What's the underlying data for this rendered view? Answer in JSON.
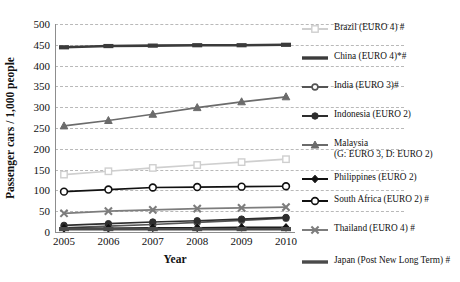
{
  "chart_data": {
    "type": "line",
    "title": "",
    "xlabel": "Year",
    "ylabel": "Passenger cars / 1,000 people",
    "x": [
      2005,
      2006,
      2007,
      2008,
      2009,
      2010
    ],
    "xticklabels": [
      "2005",
      "2006",
      "2007",
      "2008",
      "2009",
      "2010"
    ],
    "yticklabels": [
      "0",
      "50",
      "100",
      "150",
      "200",
      "250",
      "300",
      "350",
      "400",
      "450",
      "500"
    ],
    "ylim": [
      0,
      500
    ],
    "ytick_step": 50,
    "grid": "horizontal-dashed",
    "legend_position": "right-outside",
    "series": [
      {
        "name": "Brazil (EURO 4) #",
        "legend_label": "Brazil (EURO 4) #",
        "color": "#cfcfcf",
        "marker": "square-open",
        "values": [
          138,
          146,
          154,
          161,
          168,
          175
        ]
      },
      {
        "name": "China  (EURO 4)*#",
        "legend_label": "China  (EURO 4)*#",
        "color": "#3b3b3b",
        "marker": "rect-thick",
        "values": [
          444,
          447,
          448,
          449,
          449,
          450
        ]
      },
      {
        "name": "India (EURO 3)#",
        "legend_label": "India (EURO 3)#",
        "color": "#555555",
        "marker": "circle-small",
        "values": [
          10,
          14,
          18,
          23,
          28,
          33
        ]
      },
      {
        "name": "Indonesia (EURO 2)",
        "legend_label": "Indonesia (EURO 2)",
        "color": "#2e2e2e",
        "marker": "circle-filled",
        "values": [
          16,
          20,
          24,
          27,
          31,
          35
        ]
      },
      {
        "name": "Malaysia (G: EURO 3, D: EURO 2)",
        "legend_label": "Malaysia",
        "legend_label2": "(G: EURO 3, D: EURO 2)",
        "color": "#6b6b6b",
        "marker": "triangle-filled",
        "values": [
          255,
          268,
          283,
          299,
          313,
          325
        ]
      },
      {
        "name": "Philippines (EURO 2)",
        "legend_label": "Philippines (EURO 2)",
        "color": "#111111",
        "marker": "diamond-filled",
        "values": [
          9,
          9,
          10,
          10,
          11,
          11
        ]
      },
      {
        "name": "South Africa (EURO 2) #",
        "legend_label": "South Africa (EURO 2) #",
        "color": "#111111",
        "marker": "circle-open",
        "values": [
          97,
          102,
          107,
          108,
          109,
          110
        ]
      },
      {
        "name": "Thailand (EURO 4) #",
        "legend_label": "Thailand (EURO 4) #",
        "color": "#7d7d7d",
        "marker": "x-cross",
        "values": [
          45,
          50,
          53,
          56,
          58,
          60
        ]
      },
      {
        "name": "Japan (Post New Long Term) #",
        "legend_label": "Japan (Post New Long Term) #",
        "color": "#4a4a4a",
        "marker": "rect-thick",
        "values": [
          7,
          7,
          7,
          7,
          7,
          7
        ]
      }
    ]
  }
}
